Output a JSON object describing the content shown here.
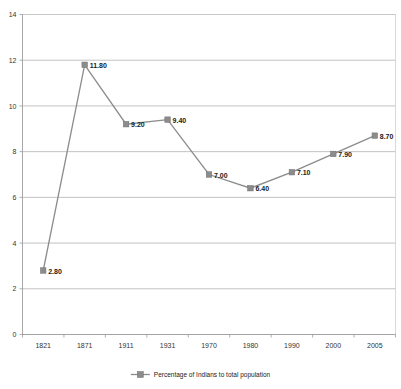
{
  "chart_data": {
    "type": "line",
    "title": "",
    "xlabel": "",
    "ylabel": "",
    "categories": [
      "1821",
      "1871",
      "1911",
      "1931",
      "1970",
      "1980",
      "1990",
      "2000",
      "2005"
    ],
    "values": [
      2.8,
      11.8,
      9.2,
      9.4,
      7.0,
      6.4,
      7.1,
      7.9,
      8.7
    ],
    "data_labels": [
      "2.80",
      "11.80",
      "9.20",
      "9.40",
      "7.00",
      "6.40",
      "7.10",
      "7.90",
      "8.70"
    ],
    "series": [
      {
        "name": "Percentage of Indians to total population",
        "values": [
          2.8,
          11.8,
          9.2,
          9.4,
          7.0,
          6.4,
          7.1,
          7.9,
          8.7
        ]
      }
    ],
    "ylim": [
      0,
      14
    ],
    "ytick_labels": [
      "0",
      "2",
      "4",
      "6",
      "8",
      "10",
      "12",
      "14"
    ],
    "ytick_values": [
      0,
      2,
      4,
      6,
      8,
      10,
      12,
      14
    ],
    "grid": true,
    "grid_axis": "y",
    "legend_position": "bottom",
    "marker": "square",
    "series_color": "#8c8c8c",
    "grid_color": "#a6a6a6",
    "background_color": "#ffffff"
  },
  "legend": {
    "entries": [
      {
        "label": "Percentage of Indians to total population",
        "color": "#8c8c8c"
      }
    ]
  }
}
